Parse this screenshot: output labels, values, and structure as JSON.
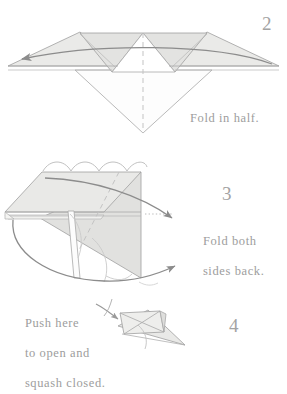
{
  "document": {
    "type": "origami-instruction-diagram",
    "background_color": "#ffffff"
  },
  "palette": {
    "paper_fill": "#e9e9e7",
    "paper_fill_light": "#f1f1ef",
    "paper_fill_dark": "#dededc",
    "outline": "#a0a0a0",
    "outline_soft": "#b8b8b8",
    "crease_dashed": "#bdbdbd",
    "arrow": "#8c8c8c",
    "text": "#9d9d9d"
  },
  "steps": [
    {
      "number": "2",
      "caption": "Fold in half.",
      "icon": "fold-in-half-arrow",
      "arrow_direction": "right-to-left",
      "crease": "vertical-dashed-center"
    },
    {
      "number": "3",
      "caption_line1": "Fold both",
      "caption_line2": "sides back.",
      "icon": "fold-both-sides-back-arrows",
      "arrow_direction": "wrap-around-back",
      "crease": "diagonal-dashed"
    },
    {
      "number": "4",
      "caption_line1": "Push here",
      "caption_line2": "to open and",
      "caption_line3": "squash closed.",
      "icon": "push-arrow",
      "arrow_direction": "push-inward"
    }
  ]
}
